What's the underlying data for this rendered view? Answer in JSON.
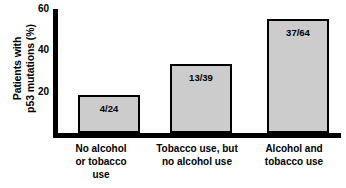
{
  "chart_data": {
    "type": "bar",
    "title": "",
    "xlabel": "",
    "ylabel": "Patients with\np53 mutations (%)",
    "ylim": [
      0,
      60
    ],
    "yticks": [
      20,
      40,
      60
    ],
    "ytick_labels": [
      "20",
      "40",
      "60"
    ],
    "grid": false,
    "legend": false,
    "categories": [
      "No alcohol\nor tobacco\nuse",
      "Tobacco use, but\nno alcohol use",
      "Alcohol and\ntobacco use"
    ],
    "values": [
      18.5,
      33.3,
      55.0
    ],
    "data_labels": [
      "4/24",
      "13/39",
      "37/64"
    ],
    "bar_color": "#cccccc",
    "bar_edge_color": "#000000",
    "axis_color": "#000000",
    "background_color": "#ffffff"
  }
}
